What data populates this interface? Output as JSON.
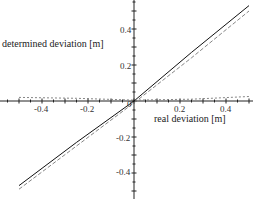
{
  "chart_data": {
    "type": "line",
    "title": "",
    "xlabel": "real deviation [m]",
    "ylabel": "determined deviation [m]",
    "xlim": [
      -0.5,
      0.5
    ],
    "ylim": [
      -0.5,
      0.55
    ],
    "x_ticks": [
      "-0.4",
      "-0.2",
      "0.2",
      "0.4"
    ],
    "y_ticks": [
      "0.4",
      "0.2",
      "-0.2",
      "-0.4"
    ],
    "origin_label": "0",
    "grid": false,
    "legend": null,
    "series": [
      {
        "name": "solid",
        "style": "solid",
        "x": [
          -0.5,
          -0.25,
          0,
          0.25,
          0.5
        ],
        "y": [
          -0.47,
          -0.23,
          0.0,
          0.27,
          0.53
        ]
      },
      {
        "name": "dashed",
        "style": "dashed",
        "x": [
          -0.5,
          -0.25,
          0,
          0.25,
          0.5
        ],
        "y": [
          -0.49,
          -0.25,
          -0.01,
          0.24,
          0.5
        ]
      },
      {
        "name": "dotted-near-zero",
        "style": "dotted",
        "x": [
          -0.5,
          -0.25,
          0,
          0.25,
          0.5
        ],
        "y": [
          0.02,
          0.015,
          0.005,
          0.01,
          0.025
        ]
      }
    ]
  }
}
